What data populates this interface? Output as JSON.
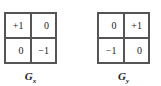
{
  "kernels": [
    {
      "name": "Gx",
      "label_main": "G",
      "label_sub": "x",
      "cells": [
        "+1",
        "0",
        "0",
        "−1"
      ]
    },
    {
      "name": "Gy",
      "label_main": "G",
      "label_sub": "y",
      "cells": [
        "0",
        "+1",
        "−1",
        "0"
      ]
    }
  ]
}
